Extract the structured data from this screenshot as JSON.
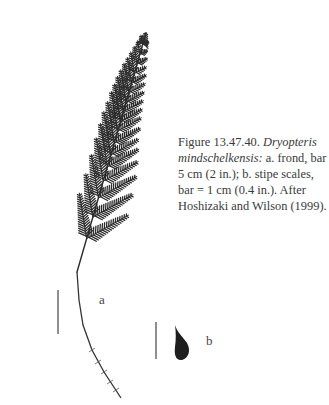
{
  "figure": {
    "number": "Figure 13.47.40.",
    "species": "Dryopteris mindschelkensis:",
    "caption_lines": [
      {
        "pre": "Figure 13.47.40. ",
        "ital": "Dryopteris",
        "post": ""
      },
      {
        "pre": "",
        "ital": "mindschelkensis:",
        "post": " a. frond, bar ="
      },
      {
        "pre": "5 cm (2 in.); b. stipe scales,",
        "ital": "",
        "post": ""
      },
      {
        "pre": "bar = 1 cm (0.4 in.). After",
        "ital": "",
        "post": ""
      },
      {
        "pre": "Hoshizaki and Wilson (1999).",
        "ital": "",
        "post": ""
      }
    ],
    "panel_labels": {
      "a": "a",
      "b": "b"
    },
    "ink_color": "#2b2b2b",
    "frond": {
      "tip": [
        146,
        33
      ],
      "rachis_base": [
        77,
        272
      ],
      "pinnae": [
        {
          "t": 0.05,
          "lenL": 10,
          "lenR": 7
        },
        {
          "t": 0.09,
          "lenL": 14,
          "lenR": 9
        },
        {
          "t": 0.13,
          "lenL": 18,
          "lenR": 12
        },
        {
          "t": 0.17,
          "lenL": 22,
          "lenR": 14
        },
        {
          "t": 0.21,
          "lenL": 26,
          "lenR": 17
        },
        {
          "t": 0.25,
          "lenL": 30,
          "lenR": 19
        },
        {
          "t": 0.29,
          "lenL": 33,
          "lenR": 21
        },
        {
          "t": 0.33,
          "lenL": 36,
          "lenR": 23
        },
        {
          "t": 0.37,
          "lenL": 38,
          "lenR": 25
        },
        {
          "t": 0.41,
          "lenL": 40,
          "lenR": 27
        },
        {
          "t": 0.46,
          "lenL": 42,
          "lenR": 30
        },
        {
          "t": 0.51,
          "lenL": 44,
          "lenR": 32
        },
        {
          "t": 0.56,
          "lenL": 44,
          "lenR": 36
        },
        {
          "t": 0.62,
          "lenL": 44,
          "lenR": 40
        },
        {
          "t": 0.69,
          "lenL": 44,
          "lenR": 44
        },
        {
          "t": 0.77,
          "lenL": 44,
          "lenR": 46
        },
        {
          "t": 0.86,
          "lenL": 46,
          "lenR": 48
        }
      ],
      "stipe": [
        [
          77,
          272
        ],
        [
          79,
          300
        ],
        [
          83,
          325
        ],
        [
          92,
          350
        ],
        [
          104,
          372
        ],
        [
          121,
          398
        ]
      ]
    },
    "scale_bar_a": {
      "x": 58,
      "y1": 290,
      "y2": 334
    },
    "scale_bar_b": {
      "x": 156,
      "y1": 322,
      "y2": 359
    }
  }
}
